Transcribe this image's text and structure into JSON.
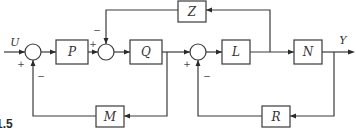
{
  "diagram": {
    "type": "block-diagram",
    "figure_label": "1.5",
    "input_signal": "U",
    "output_signal": "Y",
    "blocks": [
      {
        "id": "P",
        "label": "P"
      },
      {
        "id": "Q",
        "label": "Q"
      },
      {
        "id": "L",
        "label": "L"
      },
      {
        "id": "N",
        "label": "N"
      },
      {
        "id": "Z",
        "label": "Z"
      },
      {
        "id": "M",
        "label": "M"
      },
      {
        "id": "R",
        "label": "R"
      }
    ],
    "summing_junctions": [
      {
        "id": "S1",
        "signs": {
          "input_U": "+",
          "feedback_M": "−"
        }
      },
      {
        "id": "S2",
        "signs": {
          "from_P": "+",
          "feedback_Z": "−"
        }
      },
      {
        "id": "S3",
        "signs": {
          "from_Q": "+",
          "feedback_R": "−"
        }
      }
    ],
    "connections": [
      {
        "from": "U",
        "to": "S1"
      },
      {
        "from": "S1",
        "to": "P"
      },
      {
        "from": "P",
        "to": "S2"
      },
      {
        "from": "S2",
        "to": "Q"
      },
      {
        "from": "Q",
        "to": "S3"
      },
      {
        "from": "Q",
        "to": "M"
      },
      {
        "from": "M",
        "to": "S1"
      },
      {
        "from": "S3",
        "to": "L"
      },
      {
        "from": "L",
        "to": "N"
      },
      {
        "from": "L",
        "to": "Z"
      },
      {
        "from": "Z",
        "to": "S2"
      },
      {
        "from": "N",
        "to": "Y"
      },
      {
        "from": "N",
        "to": "R"
      },
      {
        "from": "R",
        "to": "S3"
      }
    ]
  }
}
